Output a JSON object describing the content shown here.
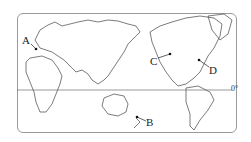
{
  "map": {
    "type": "world-political-outline",
    "projection": "pacific-centered",
    "labels": [
      {
        "id": "A",
        "text": "A"
      },
      {
        "id": "B",
        "text": "B"
      },
      {
        "id": "C",
        "text": "C"
      },
      {
        "id": "D",
        "text": "D"
      }
    ],
    "equator_label": "0°",
    "colors": {
      "line": "#333333",
      "border": "#9a9a9a",
      "background": "#ffffff"
    }
  }
}
